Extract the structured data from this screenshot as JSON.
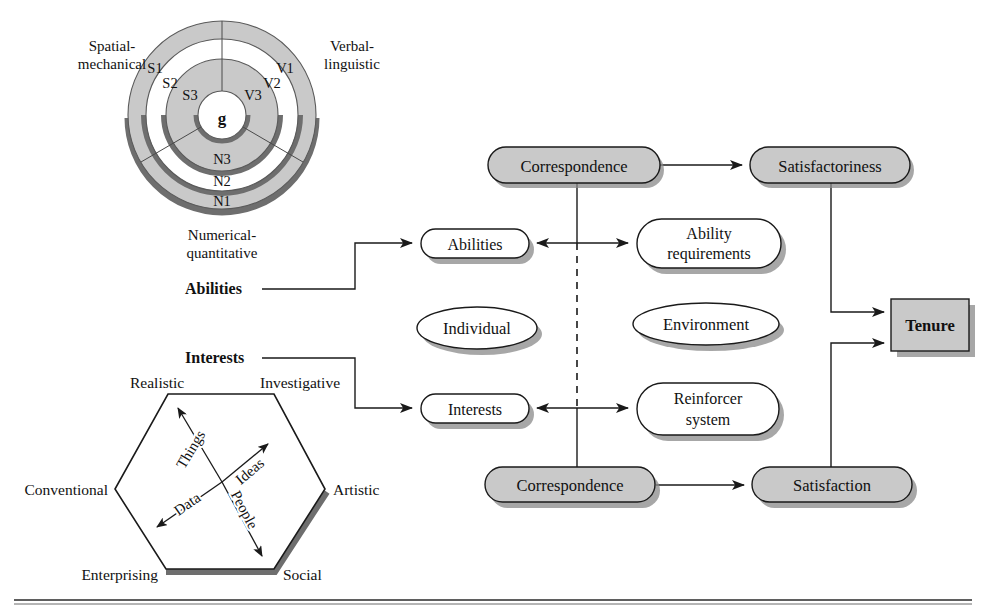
{
  "figure": {
    "bottom_rule": true
  },
  "radex": {
    "name": "radex-intelligence-model",
    "center_label": "g",
    "sector_labels": {
      "spatial": "Spatial-\nmechanical",
      "verbal": "Verbal-\nlinguistic",
      "numerical": "Numerical-\nquantitative"
    },
    "spatial_title_line1": "Spatial-",
    "spatial_title_line2": "mechanical",
    "verbal_title_line1": "Verbal-",
    "verbal_title_line2": "linguistic",
    "numerical_title_line1": "Numerical-",
    "numerical_title_line2": "quantitative",
    "ring_labels": [
      "S1",
      "S2",
      "S3",
      "V1",
      "V2",
      "V3",
      "N1",
      "N2",
      "N3"
    ],
    "band_fill": "#c9c9c9",
    "band_white": "#ffffff",
    "stroke": "#3a3a3a"
  },
  "hexagon": {
    "name": "holland-riasec-hexagon",
    "vertices": [
      "Realistic",
      "Investigative",
      "Artistic",
      "Social",
      "Enterprising",
      "Conventional"
    ],
    "axes": [
      "Things",
      "Ideas",
      "Data",
      "People"
    ],
    "stroke": "#1a1a1a",
    "shadow": "#6e6e6e"
  },
  "connectors": {
    "abilities_label": "Abilities",
    "interests_label": "Interests"
  },
  "flow": {
    "nodes": [
      {
        "id": "correspondence-top",
        "label": "Correspondence",
        "shape": "stadium",
        "fill": "#c9c9c9"
      },
      {
        "id": "satisfactoriness",
        "label": "Satisfactoriness",
        "shape": "stadium",
        "fill": "#c9c9c9"
      },
      {
        "id": "abilities",
        "label": "Abilities",
        "shape": "stadium",
        "fill": "#ffffff"
      },
      {
        "id": "ability-requirements",
        "label": "Ability\nrequirements",
        "line1": "Ability",
        "line2": "requirements",
        "shape": "stadium",
        "fill": "#ffffff"
      },
      {
        "id": "individual",
        "label": "Individual",
        "shape": "ellipse",
        "fill": "#ffffff"
      },
      {
        "id": "environment",
        "label": "Environment",
        "shape": "ellipse",
        "fill": "#ffffff"
      },
      {
        "id": "interests",
        "label": "Interests",
        "shape": "stadium",
        "fill": "#ffffff"
      },
      {
        "id": "reinforcer-system",
        "label": "Reinforcer\nsystem",
        "line1": "Reinforcer",
        "line2": "system",
        "shape": "stadium",
        "fill": "#ffffff"
      },
      {
        "id": "correspondence-bottom",
        "label": "Correspondence",
        "shape": "stadium",
        "fill": "#c9c9c9"
      },
      {
        "id": "satisfaction",
        "label": "Satisfaction",
        "shape": "stadium",
        "fill": "#c9c9c9"
      },
      {
        "id": "tenure",
        "label": "Tenure",
        "shape": "rect",
        "fill": "#c9c9c9"
      }
    ],
    "labels": {
      "correspondence_top": "Correspondence",
      "satisfactoriness": "Satisfactoriness",
      "abilities": "Abilities",
      "ability_req_line1": "Ability",
      "ability_req_line2": "requirements",
      "individual": "Individual",
      "environment": "Environment",
      "interests": "Interests",
      "reinforcer_line1": "Reinforcer",
      "reinforcer_line2": "system",
      "correspondence_bottom": "Correspondence",
      "satisfaction": "Satisfaction",
      "tenure": "Tenure"
    }
  }
}
